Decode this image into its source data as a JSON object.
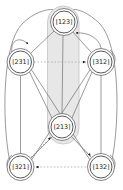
{
  "diagram": {
    "background_color": "#ffffff",
    "highlight": {
      "name": "highlight-capsule",
      "fill_color": "#e6e6e6",
      "stroke_color": "#bdbdbd",
      "covers": [
        "123",
        "213"
      ]
    },
    "node_style": {
      "outer_stroke_color": "#555555",
      "inner_stroke_color": "#3d3d3d",
      "fill_color": "#ffffff",
      "outer_radius": 13.5,
      "inner_radius": 11.0
    },
    "edge_style": {
      "solid_color": "#6b6b6b",
      "dotted_color": "#9a9a9a",
      "arrow_color": "#1a1a1a"
    },
    "nodes": [
      {
        "id": "123",
        "label": "[123]",
        "cx": 64,
        "cy": 22,
        "position": "top"
      },
      {
        "id": "231",
        "label": "[231]",
        "cx": 20.5,
        "cy": 62,
        "position": "upper-left"
      },
      {
        "id": "312",
        "label": "[312]",
        "cx": 101,
        "cy": 62,
        "position": "upper-right"
      },
      {
        "id": "213",
        "label": "[213]",
        "cx": 62,
        "cy": 127,
        "position": "center"
      },
      {
        "id": "321",
        "label": "[321]",
        "cx": 20.5,
        "cy": 167,
        "position": "lower-left"
      },
      {
        "id": "132",
        "label": "[132]",
        "cx": 101,
        "cy": 167,
        "position": "lower-right"
      }
    ],
    "edges": [
      {
        "from": "123",
        "to": "231",
        "style": "solid",
        "arrow": true,
        "kind": "curved"
      },
      {
        "from": "312",
        "to": "123",
        "style": "solid",
        "arrow": true,
        "kind": "curved"
      },
      {
        "from": "231",
        "to": "312",
        "style": "dotted",
        "arrow": true,
        "kind": "straight"
      },
      {
        "from": "123",
        "to": "213",
        "style": "solid",
        "arrow": false,
        "kind": "straight"
      },
      {
        "from": "231",
        "to": "321",
        "style": "solid",
        "arrow": false,
        "kind": "straight"
      },
      {
        "from": "312",
        "to": "132",
        "style": "solid",
        "arrow": false,
        "kind": "straight"
      },
      {
        "from": "231",
        "to": "213",
        "style": "solid",
        "arrow": false,
        "kind": "straight"
      },
      {
        "from": "312",
        "to": "213",
        "style": "solid",
        "arrow": false,
        "kind": "straight"
      },
      {
        "from": "231",
        "to": "132",
        "style": "solid",
        "arrow": false,
        "kind": "straight"
      },
      {
        "from": "312",
        "to": "321",
        "style": "solid",
        "arrow": false,
        "kind": "straight"
      },
      {
        "from": "321",
        "to": "213",
        "style": "dotted",
        "arrow": true,
        "kind": "straight"
      },
      {
        "from": "213",
        "to": "132",
        "style": "dotted",
        "arrow": true,
        "kind": "straight"
      },
      {
        "from": "321",
        "to": "132",
        "style": "dotted",
        "arrow": false,
        "kind": "straight"
      },
      {
        "from": "132",
        "to": "321",
        "style": "dotted",
        "arrow": true,
        "kind": "curved"
      },
      {
        "from": "321",
        "to": "123",
        "style": "solid",
        "arrow": false,
        "kind": "outer-curve"
      },
      {
        "from": "132",
        "to": "123",
        "style": "solid",
        "arrow": false,
        "kind": "outer-curve"
      }
    ]
  }
}
